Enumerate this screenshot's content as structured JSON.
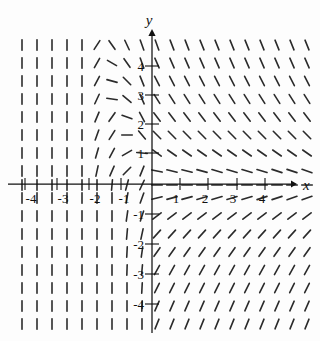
{
  "figure": {
    "name": "direction-field-plot",
    "title": "",
    "x_axis": {
      "label": "x"
    },
    "y_axis": {
      "label": "y"
    }
  },
  "chart_data": {
    "type": "slope_field",
    "x_range": [
      -4.7,
      5.2
    ],
    "y_range": [
      -4.8,
      4.8
    ],
    "grid_on": false,
    "x_tick_values": [
      -4,
      -3,
      -2,
      -1,
      1,
      2,
      3,
      4
    ],
    "y_tick_values": [
      4,
      3,
      2,
      1,
      -1,
      -2,
      -3,
      -4
    ],
    "x_ticks": [
      {
        "label": "-4",
        "x": 25,
        "lx": 31
      },
      {
        "label": "-3",
        "x": 57,
        "lx": 63
      },
      {
        "label": "-2",
        "x": 89,
        "lx": 95
      },
      {
        "label": "-1",
        "x": 121,
        "lx": 124
      },
      {
        "label": "1",
        "x": 180,
        "lx": 176
      },
      {
        "label": "2",
        "x": 208,
        "lx": 205
      },
      {
        "label": "3",
        "x": 237,
        "lx": 233
      },
      {
        "label": "4",
        "x": 265,
        "lx": 262
      }
    ],
    "y_ticks": [
      {
        "label": "4",
        "y": 66
      },
      {
        "label": "3",
        "y": 95
      },
      {
        "label": "2",
        "y": 124
      },
      {
        "label": "1",
        "y": 153
      },
      {
        "label": "-1",
        "y": 214
      },
      {
        "label": "-2",
        "y": 244
      },
      {
        "label": "-3",
        "y": 274
      },
      {
        "label": "-4",
        "y": 304
      }
    ],
    "layout": {
      "origin_px": [
        152,
        184
      ],
      "unit_px": 29,
      "x_axis_px": {
        "x1": 8,
        "x2": 291,
        "arrow_tip": 297,
        "y": 184
      },
      "y_axis_px": {
        "y1": 333,
        "y2": 36,
        "arrow_tip": 29,
        "x": 152
      },
      "dash_length_px": 10.5,
      "dash_color": "#2b2b2b",
      "axis_color": "#111111"
    },
    "field_grid": {
      "col_px": [
        22,
        37,
        52,
        67,
        82,
        97,
        112,
        127,
        142,
        157,
        172,
        187,
        202,
        217,
        232,
        247,
        262,
        277,
        292,
        307
      ],
      "row_px": [
        45,
        63,
        81,
        99,
        117,
        135,
        153,
        171,
        185,
        198,
        216,
        234,
        252,
        270,
        288,
        306,
        324
      ],
      "angle_convention": "degrees counterclockwise from horizontal; 90 = vertical; negative = downhill left-to-right",
      "angles_deg": [
        [
          90,
          90,
          90,
          90,
          90,
          57,
          -55,
          -65,
          -70,
          -70,
          -69,
          -69,
          -68,
          -68,
          -68,
          -68,
          -68,
          -68,
          -68,
          -68
        ],
        [
          90,
          90,
          90,
          90,
          90,
          60,
          -30,
          -55,
          -70,
          -66,
          -66,
          -66,
          -66,
          -66,
          -66,
          -66,
          -66,
          -66,
          -66,
          -66
        ],
        [
          90,
          90,
          90,
          90,
          90,
          62,
          -15,
          -45,
          -68,
          -63,
          -63,
          -63,
          -63,
          -63,
          -63,
          -63,
          -63,
          -63,
          -63,
          -63
        ],
        [
          90,
          90,
          90,
          90,
          90,
          65,
          -8,
          -40,
          -66,
          -58,
          -58,
          -58,
          -58,
          -58,
          -58,
          -58,
          -58,
          -58,
          -58,
          -58
        ],
        [
          90,
          90,
          90,
          90,
          90,
          67,
          55,
          -20,
          -62,
          -52,
          -52,
          -52,
          -52,
          -52,
          -52,
          -52,
          -52,
          -52,
          -52,
          -52
        ],
        [
          90,
          90,
          90,
          90,
          90,
          70,
          58,
          0,
          -50,
          -45,
          -45,
          -45,
          -45,
          -45,
          -45,
          -45,
          -45,
          -45,
          -45,
          -45
        ],
        [
          90,
          90,
          90,
          90,
          90,
          74,
          62,
          30,
          -5,
          -36,
          -35,
          -35,
          -35,
          -35,
          -35,
          -35,
          -35,
          -35,
          -35,
          -35
        ],
        [
          90,
          90,
          90,
          90,
          90,
          78,
          66,
          45,
          68,
          -12,
          -13,
          -14,
          -15,
          -16,
          -16,
          -17,
          -17,
          -18,
          -18,
          -19
        ],
        [
          90,
          90,
          90,
          90,
          90,
          90,
          85,
          75,
          65,
          0,
          0,
          0,
          0,
          0,
          0,
          0,
          0,
          0,
          0,
          0
        ],
        [
          90,
          90,
          90,
          90,
          90,
          90,
          90,
          80,
          70,
          14,
          15,
          15,
          16,
          16,
          17,
          17,
          18,
          18,
          19,
          20
        ],
        [
          90,
          90,
          90,
          90,
          90,
          90,
          90,
          82,
          72,
          38,
          38,
          38,
          38,
          38,
          38,
          38,
          38,
          38,
          38,
          38
        ],
        [
          90,
          90,
          90,
          90,
          90,
          90,
          90,
          85,
          78,
          48,
          48,
          48,
          48,
          48,
          48,
          48,
          48,
          48,
          48,
          48
        ],
        [
          90,
          90,
          90,
          90,
          90,
          90,
          90,
          87,
          82,
          55,
          55,
          55,
          55,
          55,
          55,
          55,
          55,
          55,
          55,
          55
        ],
        [
          90,
          90,
          90,
          90,
          90,
          90,
          90,
          88,
          85,
          61,
          61,
          61,
          61,
          61,
          61,
          61,
          61,
          61,
          61,
          61
        ],
        [
          90,
          90,
          90,
          90,
          90,
          90,
          90,
          90,
          87,
          64,
          64,
          64,
          64,
          64,
          64,
          64,
          64,
          64,
          64,
          64
        ],
        [
          90,
          90,
          90,
          90,
          90,
          90,
          90,
          90,
          88,
          66,
          66,
          66,
          66,
          66,
          66,
          66,
          66,
          66,
          66,
          66
        ],
        [
          90,
          90,
          90,
          90,
          90,
          90,
          90,
          90,
          90,
          68,
          68,
          68,
          68,
          68,
          68,
          68,
          68,
          68,
          68,
          68
        ]
      ]
    }
  }
}
